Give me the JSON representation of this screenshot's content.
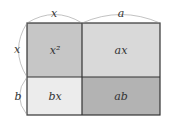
{
  "diagram": {
    "top_labels": {
      "x": "x",
      "a": "a"
    },
    "side_labels": {
      "x": "x",
      "b": "b"
    },
    "cells": {
      "x2": {
        "label": "x²",
        "color": "#c6c6c6"
      },
      "ax": {
        "label": "ax",
        "color": "#d9d9d9"
      },
      "bx": {
        "label": "bx",
        "color": "#ececec"
      },
      "ab": {
        "label": "ab",
        "color": "#b3b3b3"
      }
    }
  }
}
